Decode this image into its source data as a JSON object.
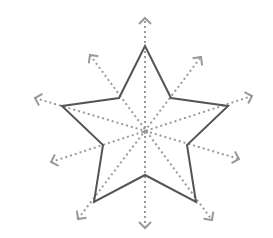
{
  "diagram": {
    "colors": {
      "outline": "#555555",
      "dotted": "#9a9a9a",
      "background": "#ffffff"
    },
    "center": [
      145,
      132
    ],
    "star_points": [
      [
        145,
        46
      ],
      [
        171,
        98
      ],
      [
        228,
        106
      ],
      [
        187,
        145
      ],
      [
        196,
        202
      ],
      [
        145,
        175
      ],
      [
        94,
        202
      ],
      [
        103,
        145
      ],
      [
        62,
        106
      ],
      [
        119,
        98
      ]
    ],
    "symmetry_lines": [
      {
        "from": [
          145,
          228
        ],
        "to": [
          145,
          18
        ]
      },
      {
        "from": [
          78,
          219
        ],
        "to": [
          201,
          57
        ]
      },
      {
        "from": [
          35,
          98
        ],
        "to": [
          239,
          159
        ]
      },
      {
        "from": [
          51,
          162
        ],
        "to": [
          252,
          96
        ]
      },
      {
        "from": [
          90,
          55
        ],
        "to": [
          212,
          220
        ]
      }
    ]
  }
}
